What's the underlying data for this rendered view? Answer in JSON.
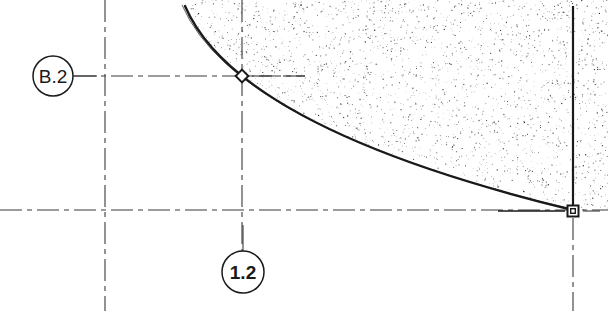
{
  "drawing": {
    "title": "Architectural section detail with curved slab edge",
    "background_color": "#ffffff",
    "line_color": "#1a1a1a",
    "grid_line_color": "#3a3a3a",
    "hatch_color": "#2b2b2b",
    "width": 608,
    "height": 311
  },
  "grid_bubbles": [
    {
      "name": "grid-bubble-b2",
      "label": "B.2",
      "axis": "horizontal",
      "center_x": 53,
      "center_y": 76,
      "radius": 20,
      "bold": false
    },
    {
      "name": "grid-bubble-1-2",
      "label": "1.2",
      "axis": "vertical",
      "center_x": 243,
      "center_y": 272,
      "radius": 21,
      "bold": true
    }
  ],
  "grid_lines": [
    {
      "name": "grid-line-b2-horizontal",
      "orientation": "horizontal",
      "y": 76,
      "x_start": 74,
      "x_end": 305,
      "style": "dash-dot"
    },
    {
      "name": "grid-line-lower-horizontal",
      "orientation": "horizontal",
      "y": 210,
      "x_start": 0,
      "x_end": 608,
      "style": "dash-dot"
    },
    {
      "name": "grid-line-left-vertical",
      "orientation": "vertical",
      "x": 105,
      "y_start": 0,
      "y_end": 311,
      "style": "dash-dot"
    },
    {
      "name": "grid-line-1-2-vertical",
      "orientation": "vertical",
      "x": 242,
      "y_start": 0,
      "y_end": 251,
      "style": "dash-dot"
    },
    {
      "name": "grid-line-right-vertical-below",
      "orientation": "vertical",
      "x": 573,
      "y_start": 218,
      "y_end": 311,
      "style": "dash-dot"
    }
  ],
  "solid_edges": [
    {
      "name": "wall-edge-right-vertical",
      "x": 573,
      "y_start": 6,
      "y_end": 212,
      "weight": 2.2
    },
    {
      "name": "slab-soffit-horizontal",
      "y": 211,
      "x_start": 498,
      "x_end": 565,
      "weight": 1.6
    }
  ],
  "curve": {
    "name": "curved-slab-edge",
    "type": "parabolic-arc",
    "points": [
      {
        "x": 185,
        "y": 6
      },
      {
        "x": 242,
        "y": 76
      },
      {
        "x": 573,
        "y": 210
      }
    ],
    "primary_weight": 2.4,
    "offset_weight": 0.7,
    "offset_distance": 3
  },
  "hatch": {
    "name": "earth-stipple-fill",
    "pattern": "random-dot-stipple",
    "density": 0.055,
    "dot_size_min": 0.5,
    "dot_size_max": 1.4,
    "seed": 20250114
  },
  "grips": [
    {
      "name": "grip-vertex-diamond",
      "shape": "diamond",
      "x": 242,
      "y": 76,
      "size": 9
    },
    {
      "name": "grip-endpoint-square",
      "shape": "square",
      "x": 573,
      "y": 211,
      "size": 11
    }
  ],
  "tick_marks": [
    {
      "name": "tick-node-right-dash",
      "orientation": "horizontal",
      "y": 76,
      "x_start": 252,
      "x_end": 272
    },
    {
      "name": "tick-node-far-dash",
      "orientation": "horizontal",
      "y": 76,
      "x_start": 283,
      "x_end": 305
    },
    {
      "name": "tick-grip-right-dash",
      "orientation": "horizontal",
      "y": 211,
      "x_start": 583,
      "x_end": 600
    }
  ]
}
